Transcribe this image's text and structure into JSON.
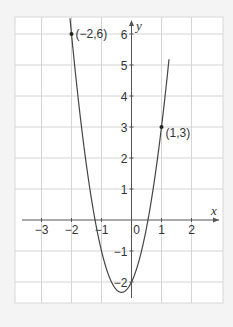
{
  "chart_data": {
    "type": "line",
    "title": "",
    "function": "y = 3x^2 + 2x - 2",
    "xlabel": "x",
    "ylabel": "y",
    "xlim": [
      -3.9,
      3.1
    ],
    "ylim": [
      -2.7,
      6.6
    ],
    "grid": true,
    "x_ticks": [
      -3,
      -2,
      -1,
      0,
      1,
      2
    ],
    "x_tick_labels": [
      "−3",
      "−2",
      "−1",
      "0",
      "1",
      "2"
    ],
    "y_ticks": [
      -2,
      -1,
      1,
      2,
      3,
      4,
      5,
      6
    ],
    "y_tick_labels": [
      "−2",
      "−1",
      "1",
      "2",
      "3",
      "4",
      "5",
      "6"
    ],
    "series": [
      {
        "name": "parabola",
        "x": [
          -2.2,
          -2,
          -1.5,
          -1,
          -0.5,
          -0.333,
          0,
          0.5,
          1,
          1.25
        ],
        "y": [
          8.12,
          6,
          3.75,
          -1,
          -1.25,
          -2.33,
          -2,
          -0.25,
          3,
          5.19
        ]
      }
    ],
    "points": [
      {
        "x": -2,
        "y": 6,
        "label": "(−2,6)"
      },
      {
        "x": 1,
        "y": 3,
        "label": "(1,3)"
      }
    ],
    "colors": {
      "background": "#f4f4f4",
      "plot_bg": "#ffffff",
      "grid": "#d4d4d4",
      "axis": "#555555",
      "curve": "#444444"
    }
  }
}
